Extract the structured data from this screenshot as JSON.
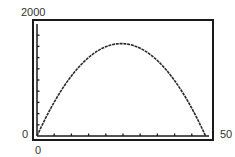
{
  "chart_data": {
    "type": "line",
    "title": "",
    "xlabel": "",
    "ylabel": "",
    "xlim": [
      0,
      50
    ],
    "ylim": [
      0,
      2000
    ],
    "x_tick_labels": [
      "0",
      "50"
    ],
    "y_tick_labels": [
      "0",
      "2000"
    ],
    "x_tick_step": 5,
    "y_tick_step": 200,
    "grid": false,
    "legend": null,
    "series": [
      {
        "name": "curve",
        "x": [
          0,
          5,
          10,
          15,
          20,
          24.5,
          30,
          35,
          40,
          45,
          49
        ],
        "values": [
          0,
          605,
          1072,
          1402,
          1595,
          1650,
          1567,
          1347,
          990,
          495,
          0
        ]
      }
    ]
  },
  "labels": {
    "y_max": "2000",
    "y_min": "0",
    "x_min": "0",
    "x_max": "50"
  },
  "colors": {
    "line": "#2a2a2a",
    "frame": "#1a1a1a",
    "background": "#ffffff"
  }
}
